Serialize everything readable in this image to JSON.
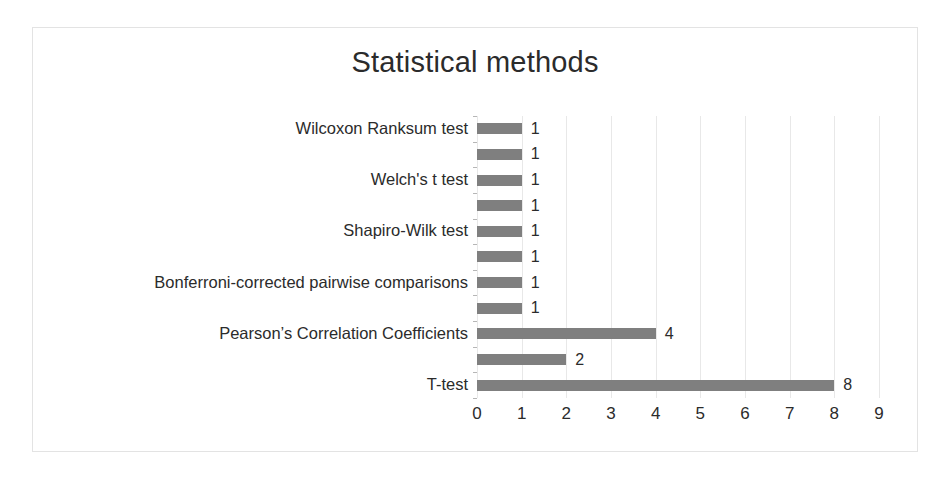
{
  "chart_data": {
    "type": "bar",
    "orientation": "horizontal",
    "title": "Statistical methods",
    "xlabel": "",
    "ylabel": "",
    "xlim": [
      0,
      9
    ],
    "xticks": [
      "0",
      "1",
      "2",
      "3",
      "4",
      "5",
      "6",
      "7",
      "8",
      "9"
    ],
    "grid": "vertical",
    "legend": "none",
    "bar_color": "#7f7f7f",
    "categories": [
      "Wilcoxon Ranksum test",
      "",
      "Welch's t test",
      "",
      "Shapiro-Wilk test",
      "",
      "Bonferroni-corrected pairwise comparisons",
      "",
      "Pearson’s Correlation Coefficients",
      "",
      "T-test"
    ],
    "values": [
      1,
      1,
      1,
      1,
      1,
      1,
      1,
      1,
      4,
      2,
      8
    ],
    "value_labels": [
      "1",
      "1",
      "1",
      "1",
      "1",
      "1",
      "1",
      "1",
      "4",
      "2",
      "8"
    ]
  },
  "frame": {
    "border_color": "#e3e3e3"
  }
}
